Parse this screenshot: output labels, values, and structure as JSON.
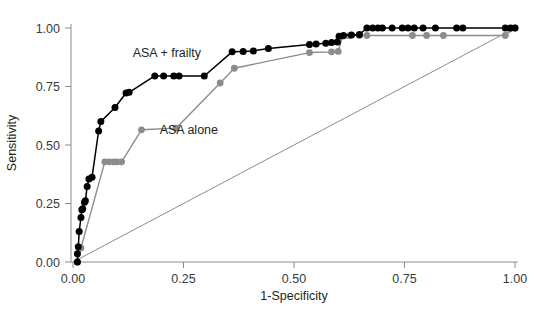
{
  "chart_data": {
    "type": "line",
    "title": "",
    "xlabel": "1-Specificity",
    "ylabel": "Sensitivity",
    "xlim": [
      0.0,
      1.0
    ],
    "ylim": [
      0.0,
      1.0
    ],
    "grid": false,
    "legend_position": "inline-annotation",
    "xticks": [
      "0.00",
      "0.25",
      "0.50",
      "0.75",
      "1.00"
    ],
    "xtick_values": [
      0.0,
      0.25,
      0.5,
      0.75,
      1.0
    ],
    "yticks": [
      "0.00",
      "0.25",
      "0.50",
      "0.75",
      "1.00"
    ],
    "ytick_values": [
      0.0,
      0.25,
      0.5,
      0.75,
      1.0
    ],
    "reference_line": {
      "name": "chance-diagonal",
      "from": [
        0.0,
        0.0
      ],
      "to": [
        1.0,
        1.0
      ],
      "color": "#8c8c8c"
    },
    "series": [
      {
        "name": "ASA + frailty",
        "color": "#000000",
        "marker": "circle",
        "annotation": "ASA + frailty",
        "annotation_at": [
          0.135,
          0.875
        ],
        "points": [
          [
            0.01,
            0.0
          ],
          [
            0.01,
            0.035
          ],
          [
            0.012,
            0.065
          ],
          [
            0.014,
            0.13
          ],
          [
            0.018,
            0.19
          ],
          [
            0.02,
            0.223
          ],
          [
            0.022,
            0.228
          ],
          [
            0.026,
            0.255
          ],
          [
            0.028,
            0.262
          ],
          [
            0.032,
            0.323
          ],
          [
            0.036,
            0.355
          ],
          [
            0.043,
            0.362
          ],
          [
            0.058,
            0.56
          ],
          [
            0.063,
            0.6
          ],
          [
            0.095,
            0.66
          ],
          [
            0.12,
            0.722
          ],
          [
            0.127,
            0.725
          ],
          [
            0.185,
            0.795
          ],
          [
            0.205,
            0.795
          ],
          [
            0.228,
            0.795
          ],
          [
            0.24,
            0.795
          ],
          [
            0.297,
            0.795
          ],
          [
            0.36,
            0.898
          ],
          [
            0.385,
            0.9
          ],
          [
            0.408,
            0.902
          ],
          [
            0.442,
            0.912
          ],
          [
            0.535,
            0.93
          ],
          [
            0.55,
            0.932
          ],
          [
            0.572,
            0.935
          ],
          [
            0.585,
            0.938
          ],
          [
            0.598,
            0.94
          ],
          [
            0.602,
            0.965
          ],
          [
            0.612,
            0.968
          ],
          [
            0.63,
            0.97
          ],
          [
            0.648,
            0.972
          ],
          [
            0.665,
            1.0
          ],
          [
            0.678,
            1.0
          ],
          [
            0.69,
            1.0
          ],
          [
            0.7,
            1.0
          ],
          [
            0.722,
            1.0
          ],
          [
            0.745,
            1.0
          ],
          [
            0.758,
            1.0
          ],
          [
            0.772,
            1.0
          ],
          [
            0.792,
            1.0
          ],
          [
            0.82,
            1.0
          ],
          [
            0.868,
            1.0
          ],
          [
            0.882,
            1.0
          ],
          [
            0.978,
            1.0
          ],
          [
            0.99,
            1.0
          ],
          [
            1.0,
            1.0
          ]
        ]
      },
      {
        "name": "ASA alone",
        "color": "#8c8c8c",
        "marker": "circle",
        "annotation": "ASA alone",
        "annotation_at": [
          0.196,
          0.545
        ],
        "points": [
          [
            0.01,
            0.0
          ],
          [
            0.018,
            0.06
          ],
          [
            0.072,
            0.428
          ],
          [
            0.082,
            0.428
          ],
          [
            0.092,
            0.428
          ],
          [
            0.1,
            0.428
          ],
          [
            0.11,
            0.428
          ],
          [
            0.155,
            0.565
          ],
          [
            0.233,
            0.572
          ],
          [
            0.333,
            0.765
          ],
          [
            0.365,
            0.828
          ],
          [
            0.535,
            0.895
          ],
          [
            0.585,
            0.898
          ],
          [
            0.6,
            0.9
          ],
          [
            0.61,
            0.965
          ],
          [
            0.625,
            0.967
          ],
          [
            0.648,
            0.968
          ],
          [
            0.665,
            0.968
          ],
          [
            0.768,
            0.968
          ],
          [
            0.8,
            0.968
          ],
          [
            0.838,
            0.968
          ],
          [
            0.978,
            0.968
          ],
          [
            1.0,
            1.0
          ]
        ]
      }
    ]
  },
  "axes": {
    "x_title": "1-Specificity",
    "y_title": "Sensitivity"
  }
}
